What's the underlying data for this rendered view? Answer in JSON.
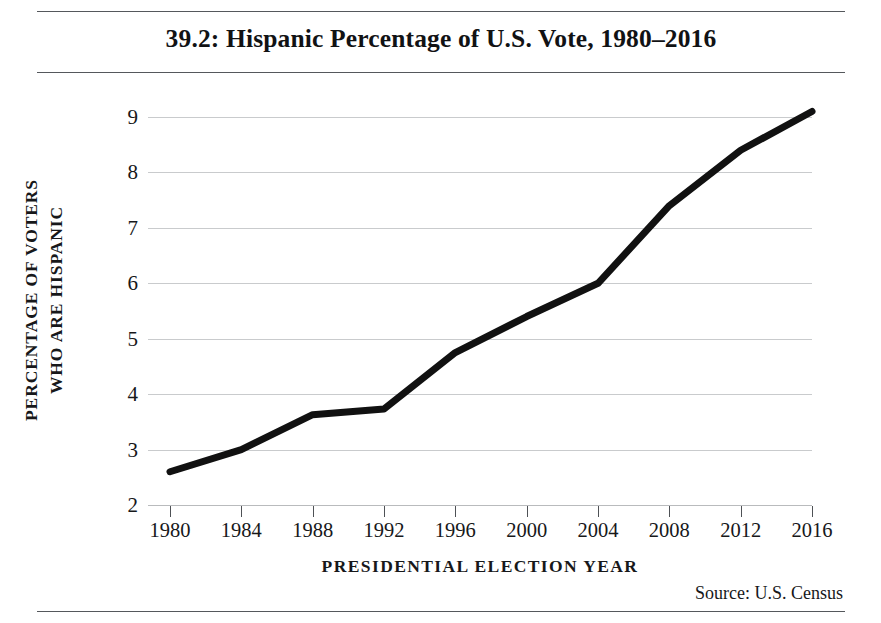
{
  "figure": {
    "title": "39.2: Hispanic Percentage of U.S. Vote, 1980–2016",
    "source": "Source:  U.S. Census",
    "rule_color": "#55585c",
    "background": "#ffffff"
  },
  "chart_data": {
    "type": "line",
    "title": "39.2: Hispanic Percentage of U.S. Vote, 1980–2016",
    "xlabel": "PRESIDENTIAL ELECTION YEAR",
    "ylabel_line1": "PERCENTAGE OF VOTERS",
    "ylabel_line2": "WHO ARE HISPANIC",
    "ylabel": "PERCENTAGE OF VOTERS WHO ARE HISPANIC",
    "categories": [
      1980,
      1984,
      1988,
      1992,
      1996,
      2000,
      2004,
      2008,
      2012,
      2016
    ],
    "x_tick_labels": [
      "1980",
      "1984",
      "1988",
      "1992",
      "1996",
      "2000",
      "2004",
      "2008",
      "2012",
      "2016"
    ],
    "values": [
      2.6,
      3.0,
      3.63,
      3.73,
      4.75,
      5.4,
      6.0,
      7.4,
      8.4,
      9.1
    ],
    "y_tick_labels": [
      "9",
      "8",
      "7",
      "6",
      "5",
      "4",
      "3",
      "2"
    ],
    "y_ticks": [
      9,
      8,
      7,
      6,
      5,
      4,
      3,
      2
    ],
    "ylim": [
      2,
      9
    ],
    "xlim": [
      1980,
      2016
    ],
    "grid": true,
    "legend": "none",
    "series_color": "#111111",
    "grid_color": "#c9cbcd",
    "line_width": 7
  }
}
